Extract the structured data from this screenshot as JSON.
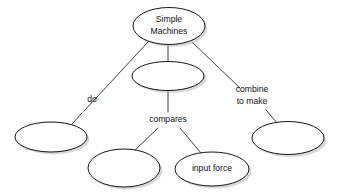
{
  "diagram": {
    "type": "concept-map",
    "background_color": "#ffffff",
    "node_fill_color": "#ffffff",
    "node_stroke_color": "#16161a",
    "shadow_color": "#b9b9bd",
    "text_color": "#111114",
    "nodes": [
      {
        "id": "simple-machines",
        "label_lines": [
          "Simple",
          "Machines"
        ],
        "line1": "Simple",
        "line2": "Machines",
        "cx": 169,
        "cy": 26,
        "rx": 36,
        "ry": 18.5,
        "blank": false
      },
      {
        "id": "node-center-blank",
        "label_lines": [],
        "line1": "",
        "line2": "",
        "cx": 168,
        "cy": 76,
        "rx": 36,
        "ry": 14.5,
        "blank": true
      },
      {
        "id": "node-left-blank",
        "label_lines": [],
        "line1": "",
        "line2": "",
        "cx": 51,
        "cy": 137,
        "rx": 36,
        "ry": 15,
        "blank": true
      },
      {
        "id": "node-bottom-left-blank",
        "label_lines": [],
        "line1": "",
        "line2": "",
        "cx": 124,
        "cy": 168,
        "rx": 36,
        "ry": 19,
        "blank": true
      },
      {
        "id": "input-force",
        "label_lines": [
          "input force"
        ],
        "line1": "input force",
        "line2": "",
        "cx": 212,
        "cy": 169,
        "rx": 37,
        "ry": 17,
        "blank": false
      },
      {
        "id": "node-right-blank",
        "label_lines": [],
        "line1": "",
        "line2": "",
        "cx": 288,
        "cy": 138,
        "rx": 36,
        "ry": 16.5,
        "blank": true
      }
    ],
    "edges": [
      {
        "id": "edge-do",
        "from": "simple-machines",
        "to": "node-left-blank",
        "label_lines": [
          "do"
        ],
        "line1": "do",
        "line2": "",
        "label_x": 92,
        "label_y": 100,
        "x1": 148,
        "y1": 42,
        "x2": 100,
        "y2": 94,
        "x3": 84,
        "y3": 111,
        "x4": 72,
        "y4": 124
      },
      {
        "id": "edge-center",
        "from": "simple-machines",
        "to": "node-center-blank",
        "label_lines": [],
        "line1": "",
        "line2": "",
        "label_x": 0,
        "label_y": 0,
        "x1": 168,
        "y1": 45,
        "x2": 168,
        "y2": 62,
        "x3": 0,
        "y3": 0,
        "x4": 0,
        "y4": 0
      },
      {
        "id": "edge-combine-to-make",
        "from": "simple-machines",
        "to": "node-right-blank",
        "label_lines": [
          "combine",
          "to make"
        ],
        "line1": "combine",
        "line2": "to make",
        "label_x": 252,
        "label_y": 95,
        "x1": 192,
        "y1": 42,
        "x2": 228,
        "y2": 80,
        "x3": 266,
        "y3": 110,
        "x4": 277,
        "y4": 124
      },
      {
        "id": "edge-compares",
        "from": "node-center-blank",
        "to": "node-bottom-left-blank",
        "label_lines": [
          "compares"
        ],
        "line1": "compares",
        "line2": "",
        "label_x": 168,
        "label_y": 120,
        "x1": 168,
        "y1": 90,
        "x2": 168,
        "y2": 112,
        "x3": 151,
        "y3": 128,
        "x4": 133,
        "y4": 150
      },
      {
        "id": "edge-compares-input-force",
        "from": "node-center-blank",
        "to": "input-force",
        "label_lines": [],
        "line1": "",
        "line2": "",
        "label_x": 0,
        "label_y": 0,
        "x1": 183,
        "y1": 128,
        "x2": 199,
        "y2": 152,
        "x3": 0,
        "y3": 0,
        "x4": 0,
        "y4": 0
      }
    ]
  }
}
